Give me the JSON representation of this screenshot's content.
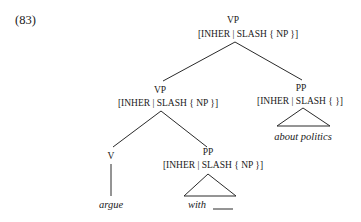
{
  "example_number": "(83)",
  "tree": {
    "root": {
      "category": "VP",
      "features": "[INHER | SLASH  { NP }]"
    },
    "vp_inner": {
      "category": "VP",
      "features": "[INHER | SLASH  { NP }]"
    },
    "pp_right": {
      "category": "PP",
      "features": "[INHER | SLASH  {   }]",
      "yield": "about politics"
    },
    "verb": {
      "category": "V",
      "word": "argue"
    },
    "pp_inner": {
      "category": "PP",
      "features": "[INHER | SLASH  { NP }]",
      "yield": "with",
      "gap": "____"
    }
  },
  "colors": {
    "ink": "#1a1a1a",
    "background": "#ffffff"
  }
}
